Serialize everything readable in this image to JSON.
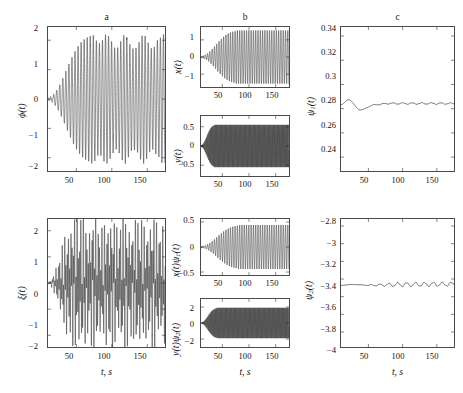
{
  "figure": {
    "width": 463,
    "height": 393,
    "background": "#ffffff",
    "line_color": "#1a1a1a",
    "axis_color": "#4a4a4a"
  },
  "panel_titles": {
    "a": "a",
    "b": "b",
    "c": "c"
  },
  "xlabel": "t, s",
  "ylabels": {
    "phi": "ϕ(t)",
    "xi": "ξ(t)",
    "x": "x(t)",
    "y": "y(t)",
    "xpsi1": "x(t)ψ",
    "xpsi1_sub": "1",
    "xpsi1_tail": "(t)",
    "ypsi2": "y(t)ψ",
    "ypsi2_sub": "2",
    "ypsi2_tail": "(t)",
    "psi1": "ψ",
    "psi1_sub": "1",
    "psi1_tail": "(t)",
    "psi2": "ψ",
    "psi2_sub": "2",
    "psi2_tail": "(t)"
  },
  "chart_data": [
    {
      "id": "phi",
      "type": "line",
      "title": "a",
      "xlabel": "t, s",
      "ylabel": "ϕ(t)",
      "xlim": [
        10,
        175
      ],
      "ylim": [
        -2.45,
        2.45
      ],
      "xticks": [
        50,
        100,
        150
      ],
      "yticks": [
        -2,
        -1,
        0,
        1,
        2
      ],
      "ytick_labels": [
        "−2",
        "−1",
        "0",
        "1",
        "2"
      ],
      "grid": false,
      "description": "Growing self-excited oscillation; amplitude rises from ~0.05 at t=10 to saturated ~2.2 by t≈70, with beat-like amplitude modulation thereafter.",
      "signal": {
        "carrier_period": 4.3,
        "envelope_start": 0.06,
        "envelope_saturate_t": 70,
        "envelope_max": 2.2,
        "beat_period": 26,
        "beat_depth": 0.22
      }
    },
    {
      "id": "xi",
      "type": "line",
      "title": "",
      "xlabel": "t, s",
      "ylabel": "ξ(t)",
      "xlim": [
        10,
        175
      ],
      "ylim": [
        -2.45,
        2.45
      ],
      "xticks": [
        50,
        100,
        150
      ],
      "yticks": [
        -2,
        -1,
        0,
        1,
        2
      ],
      "ytick_labels": [
        "−2",
        "−1",
        "0",
        "1",
        "2"
      ],
      "grid": false,
      "description": "Dense broadband oscillation; fast carrier filling a slowly-growing envelope reaching ~2.3, saturated after t≈50.",
      "signal": {
        "carrier_period": 1.75,
        "modulation_period": 4.3,
        "envelope_start": 0.05,
        "envelope_saturate_t": 50,
        "envelope_max": 2.3,
        "beat_period": 21,
        "beat_depth": 0.18
      }
    },
    {
      "id": "x",
      "type": "line",
      "title": "b",
      "xlabel": "",
      "ylabel": "x(t)",
      "xlim": [
        10,
        175
      ],
      "ylim": [
        -1.75,
        1.75
      ],
      "xticks": [
        50,
        100,
        150
      ],
      "yticks": [
        -1,
        0,
        1
      ],
      "ytick_labels": [
        "−1",
        "0",
        "1"
      ],
      "grid": false,
      "description": "Monotonic sigmoid envelope growth saturating near 1.55 at t≈75; sinusoidal carrier fills the envelope.",
      "signal": {
        "carrier_period": 4.3,
        "envelope_start": 0.07,
        "envelope_saturate_t": 75,
        "envelope_max": 1.55,
        "beat_period": 0,
        "beat_depth": 0
      }
    },
    {
      "id": "y",
      "type": "line",
      "title": "",
      "xlabel": "",
      "ylabel": "y(t)",
      "xlim": [
        10,
        175
      ],
      "ylim": [
        -0.78,
        0.78
      ],
      "xticks": [
        50,
        100,
        150
      ],
      "yticks": [
        -0.5,
        0,
        0.5
      ],
      "ytick_labels": [
        "−0.5",
        "0",
        "0.5"
      ],
      "grid": false,
      "description": "High-frequency oscillation, envelope rises sharply from 0 to ~0.55 by t≈35 then stays flat.",
      "signal": {
        "carrier_period": 1.55,
        "envelope_start": 0.02,
        "envelope_saturate_t": 35,
        "envelope_max": 0.55,
        "beat_period": 0,
        "beat_depth": 0
      }
    },
    {
      "id": "xpsi1",
      "type": "line",
      "title": "",
      "xlabel": "",
      "ylabel": "x(t)ψ₁(t)",
      "xlim": [
        10,
        175
      ],
      "ylim": [
        -0.56,
        0.56
      ],
      "xticks": [
        50,
        100,
        150
      ],
      "yticks": [
        -0.5,
        0,
        0.5
      ],
      "ytick_labels": [
        "−0.5",
        "0",
        "0.5"
      ],
      "grid": false,
      "description": "Same sigmoid envelope as x(t) scaled by ψ₁≈0.284; saturates near ±0.44 at t≈80.",
      "signal": {
        "carrier_period": 4.3,
        "envelope_start": 0.02,
        "envelope_saturate_t": 80,
        "envelope_max": 0.44,
        "beat_period": 0,
        "beat_depth": 0
      }
    },
    {
      "id": "ypsi2",
      "type": "line",
      "title": "",
      "xlabel": "t, s",
      "ylabel": "y(t)ψ₂(t)",
      "xlim": [
        10,
        175
      ],
      "ylim": [
        -3.0,
        3.0
      ],
      "xticks": [
        50,
        100,
        150
      ],
      "yticks": [
        -2,
        0,
        2
      ],
      "ytick_labels": [
        "−2",
        "0",
        "2"
      ],
      "grid": false,
      "description": "y(t) scaled by ψ₂≈−3.46; high-frequency fill with envelope saturating at ±1.9 by t≈40.",
      "signal": {
        "carrier_period": 1.55,
        "envelope_start": 0.05,
        "envelope_saturate_t": 40,
        "envelope_max": 1.9,
        "beat_period": 0,
        "beat_depth": 0
      }
    },
    {
      "id": "psi1",
      "type": "line",
      "title": "c",
      "xlabel": "",
      "ylabel": "ψ₁(t)",
      "xlim": [
        10,
        175
      ],
      "ylim": [
        0.2285,
        0.3475
      ],
      "xticks": [
        50,
        100,
        150
      ],
      "yticks": [
        0.24,
        0.26,
        0.28,
        0.3,
        0.32,
        0.34
      ],
      "ytick_labels": [
        "0.24",
        "0.26",
        "0.28",
        "0.3",
        "0.32",
        "0.34"
      ],
      "grid": false,
      "description": "Parameter estimate converging: starts 0.283, peaks 0.2875 near t=21, dips 0.2790 near t=38, settles to 0.2843 with tiny ripple.",
      "key_points": [
        {
          "t": 10,
          "v": 0.2832
        },
        {
          "t": 21,
          "v": 0.2875
        },
        {
          "t": 38,
          "v": 0.279
        },
        {
          "t": 60,
          "v": 0.2833
        },
        {
          "t": 80,
          "v": 0.2843
        },
        {
          "t": 175,
          "v": 0.2843
        }
      ],
      "settled_value": 0.2843,
      "ripple_amplitude": 0.0006,
      "ripple_period": 14
    },
    {
      "id": "psi2",
      "type": "line",
      "title": "",
      "xlabel": "t, s",
      "ylabel": "ψ₂(t)",
      "xlim": [
        10,
        175
      ],
      "ylim": [
        -4.17,
        -2.72
      ],
      "xticks": [
        50,
        100,
        150
      ],
      "yticks": [
        -4,
        -3.8,
        -3.6,
        -3.4,
        -3.2,
        -3,
        -2.8
      ],
      "ytick_labels": [
        "−4",
        "−3.8",
        "−3.6",
        "−3.4",
        "−3.2",
        "−3",
        "−2.8"
      ],
      "grid": false,
      "description": "Parameter estimate settling near −3.46 with small persistent ripple of growing regularity.",
      "key_points": [
        {
          "t": 10,
          "v": -3.472
        },
        {
          "t": 25,
          "v": -3.462
        },
        {
          "t": 50,
          "v": -3.47
        },
        {
          "t": 100,
          "v": -3.462
        },
        {
          "t": 175,
          "v": -3.458
        }
      ],
      "settled_value": -3.464,
      "ripple_amplitude": 0.022,
      "ripple_period": 13
    }
  ]
}
